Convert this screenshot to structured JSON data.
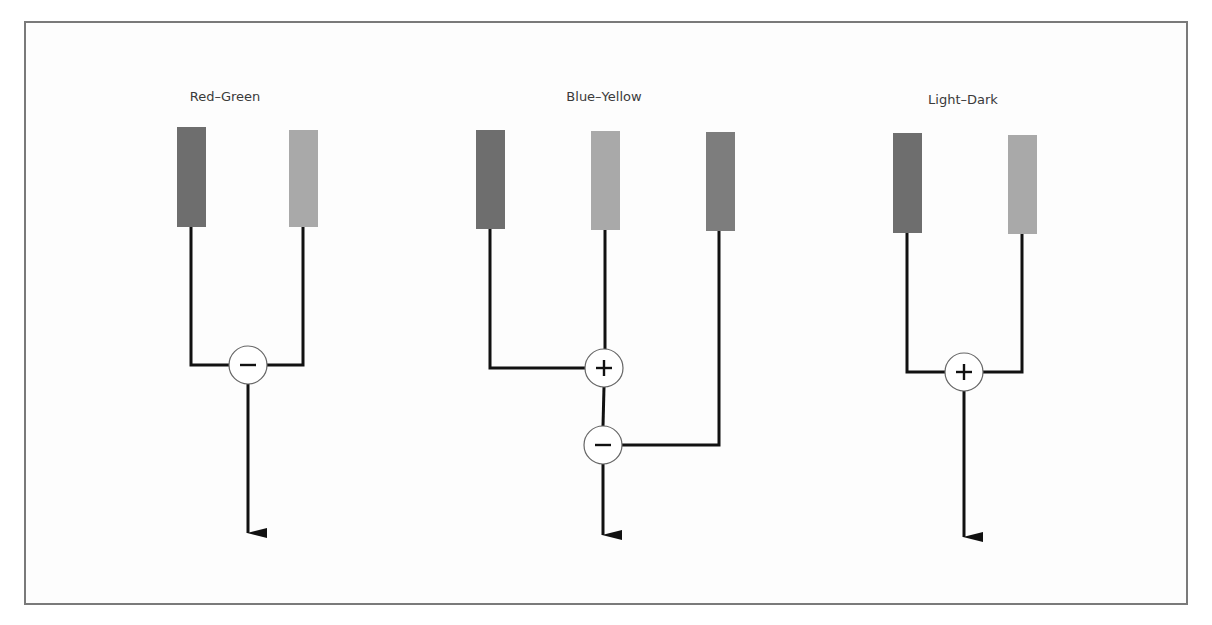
{
  "diagram": {
    "colors": {
      "frame": "#7a7a7a",
      "line": "#111111",
      "circle_fill": "#ffffff",
      "circle_stroke": "#666666",
      "bar_dark": "#6e6e6e",
      "bar_light": "#a9a9a9",
      "bar_mid": "#7d7d7d"
    },
    "channels": [
      {
        "title": "Red–Green",
        "title_x": 225,
        "bars": [
          {
            "x": 177,
            "y": 127,
            "h": 100,
            "shade": "dark",
            "line_x": 191
          },
          {
            "x": 289,
            "y": 130,
            "h": 97,
            "shade": "light",
            "line_x": 303
          }
        ],
        "operators": [
          {
            "symbol": "−",
            "name": "minus",
            "cx": 248,
            "cy": 365
          }
        ],
        "arrow": {
          "x": 248,
          "y1": 384,
          "y2": 533
        }
      },
      {
        "title": "Blue–Yellow",
        "title_x": 604,
        "bars": [
          {
            "x": 476,
            "y": 130,
            "h": 99,
            "shade": "dark",
            "line_x": 490
          },
          {
            "x": 591,
            "y": 131,
            "h": 99,
            "shade": "light",
            "line_x": 605
          },
          {
            "x": 706,
            "y": 132,
            "h": 99,
            "shade": "mid",
            "line_x": 719
          }
        ],
        "operators": [
          {
            "symbol": "+",
            "name": "plus",
            "cx": 604,
            "cy": 368
          },
          {
            "symbol": "−",
            "name": "minus",
            "cx": 603,
            "cy": 445
          }
        ],
        "arrow": {
          "x": 603,
          "y1": 464,
          "y2": 535
        }
      },
      {
        "title": "Light–Dark",
        "title_x": 963,
        "bars": [
          {
            "x": 893,
            "y": 133,
            "h": 100,
            "shade": "dark",
            "line_x": 907
          },
          {
            "x": 1008,
            "y": 135,
            "h": 99,
            "shade": "light",
            "line_x": 1022
          }
        ],
        "operators": [
          {
            "symbol": "+",
            "name": "plus",
            "cx": 964,
            "cy": 372
          }
        ],
        "arrow": {
          "x": 964,
          "y1": 391,
          "y2": 537
        }
      }
    ]
  }
}
